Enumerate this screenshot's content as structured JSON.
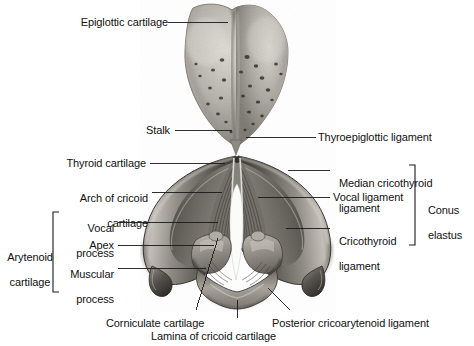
{
  "figure": {
    "type": "anatomical-photograph",
    "medium": "grayscale halftone photograph",
    "background_color": "#ffffff",
    "specimen_tones": {
      "highlight": "#d8d5cf",
      "midtone": "#9c9891",
      "shadow": "#4a4742",
      "deep_shadow": "#1e1c1a",
      "glottis_white": "#fdfdfb"
    },
    "leader_line_color": "#1a1a1a",
    "bracket_color": "#1a1a1a"
  },
  "labels": {
    "epiglottic_cartilage": "Epiglottic cartilage",
    "stalk": "Stalk",
    "thyroid_cartilage": "Thyroid cartilage",
    "arch_of_cricoid_cartilage_l1": "Arch of cricoid",
    "arch_of_cricoid_cartilage_l2": "cartilage",
    "vocal_process_l1": "Vocal",
    "vocal_process_l2": "process",
    "apex": "Apex",
    "muscular_process_l1": "Muscular",
    "muscular_process_l2": "process",
    "arytenoid_cartilage_l1": "Arytenoid",
    "arytenoid_cartilage_l2": "cartilage",
    "thyroepiglottic_ligament": "Thyroepiglottic ligament",
    "median_cricothyroid_ligament_l1": "Median cricothyroid",
    "median_cricothyroid_ligament_l2": "ligament",
    "vocal_ligament": "Vocal ligament",
    "cricothyroid_ligament_l1": "Cricothyroid",
    "cricothyroid_ligament_l2": "ligament",
    "conus_elastus_l1": "Conus",
    "conus_elastus_l2": "elastus",
    "corniculate_cartilage": "Corniculate cartilage",
    "lamina_of_cricoid_cartilage": "Lamina of cricoid cartilage",
    "posterior_cricoarytenoid_ligament": "Posterior cricoarytenoid ligament"
  },
  "brackets": [
    {
      "name": "arytenoid-cartilage-bracket",
      "side": "left",
      "groups": [
        "Vocal process",
        "Apex",
        "Muscular process"
      ]
    },
    {
      "name": "conus-elastus-bracket",
      "side": "right",
      "groups": [
        "Median cricothyroid ligament",
        "Vocal ligament",
        "Cricothyroid ligament"
      ]
    }
  ]
}
